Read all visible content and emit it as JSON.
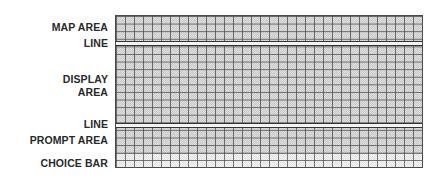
{
  "diagram": {
    "labels": {
      "map_area": "MAP AREA",
      "line_top": "LINE",
      "display_area_line1": "DISPLAY",
      "display_area_line2": "AREA",
      "line_bottom": "LINE",
      "prompt_area": "PROMPT AREA",
      "choice_bar": "CHOICE BAR"
    },
    "regions": [
      {
        "name": "MAP AREA",
        "type": "grid-region"
      },
      {
        "name": "LINE",
        "type": "double-line-divider"
      },
      {
        "name": "DISPLAY AREA",
        "type": "grid-region"
      },
      {
        "name": "LINE",
        "type": "double-line-divider"
      },
      {
        "name": "PROMPT AREA",
        "type": "grid-region"
      },
      {
        "name": "CHOICE BAR",
        "type": "grid-region-light"
      }
    ],
    "colors": {
      "grid_fill": "#d4d4d4",
      "grid_lines": "#464646",
      "divider_lines": "#333333",
      "choice_bar_fill": "#ececec",
      "label_text": "#2a2a2a"
    }
  }
}
